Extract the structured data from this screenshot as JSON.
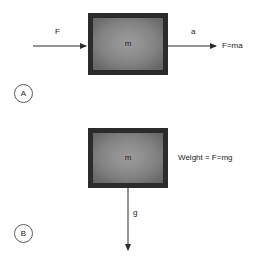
{
  "diagram": {
    "background_color": "#ffffff",
    "line_color": "#2b2b2b",
    "block_border_color": "#2b2b2b",
    "block_fill_color": "#8a8a8a",
    "text_color": "#1a1a1a",
    "panels": [
      {
        "marker": "A",
        "block_label": "m",
        "input_force_label": "F",
        "acceleration_label": "a",
        "equation_label": "F=ma"
      },
      {
        "marker": "B",
        "block_label": "m",
        "gravity_label": "g",
        "equation_label": "Weight = F=mg"
      }
    ]
  }
}
